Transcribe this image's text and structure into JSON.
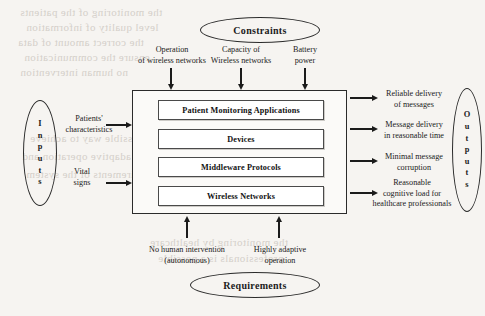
{
  "diagram": {
    "background_color": "#f6f4f1",
    "ink_color": "#1b1b1b",
    "type": "block-diagram"
  },
  "constraints": {
    "ellipse_label": "Constraints",
    "items": [
      {
        "label": "Operation\nof wireless networks"
      },
      {
        "label": "Capacity of\nWireless networks"
      },
      {
        "label": "Battery\npower"
      }
    ]
  },
  "requirements": {
    "ellipse_label": "Requirements",
    "items": [
      {
        "label": "No human intervention\n(autonomous)"
      },
      {
        "label": "Highly adaptive\noperation"
      }
    ]
  },
  "inputs": {
    "ellipse_label": "Inputs",
    "ellipse_letters": [
      "I",
      "n",
      "p",
      "u",
      "t",
      "s"
    ],
    "items": [
      {
        "label": "Patients'\ncharacteristics"
      },
      {
        "label": "Vital\nsigns"
      }
    ]
  },
  "outputs": {
    "ellipse_label": "Outputs",
    "ellipse_letters": [
      "O",
      "u",
      "t",
      "p",
      "u",
      "t",
      "s"
    ],
    "items": [
      {
        "label": "Reliable delivery\nof messages"
      },
      {
        "label": "Message delivery\nin reasonable time"
      },
      {
        "label": "Minimal message\ncorruption"
      },
      {
        "label": "Reasonable\ncognitive load for\nhealthcare professionals"
      }
    ]
  },
  "system": {
    "layers": [
      {
        "label": "Patient Monitoring Applications"
      },
      {
        "label": "Devices"
      },
      {
        "label": "Middleware Protocols"
      },
      {
        "label": "Wireless Networks"
      }
    ]
  },
  "bleed_text": {
    "lines": [
      "the monitoring of the patients",
      "level quality of information",
      "the correct amount of data",
      "ensure the communication",
      "no human intervention",
      "a possible way to achieve",
      "adaptive operation and",
      "requirements of the system",
      "the monitoring by healthcare",
      "professionals is a possible"
    ]
  }
}
